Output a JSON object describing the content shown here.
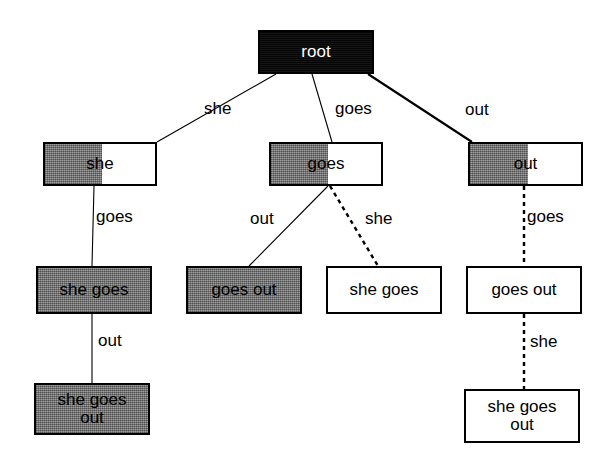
{
  "diagram": {
    "canvas": {
      "width": 601,
      "height": 468,
      "background": "#ffffff"
    },
    "colors": {
      "node_border": "#000000",
      "fill_gray": "#808080",
      "fill_black": "#0a0a0a",
      "fill_white": "#ffffff",
      "text_dark": "#000000",
      "text_light": "#ffffff",
      "edge": "#000000"
    },
    "nodes": [
      {
        "id": "root",
        "label": "root",
        "style": "black",
        "fill_fraction": 1.0,
        "x": 258,
        "y": 30,
        "w": 116,
        "h": 44,
        "level": 0
      },
      {
        "id": "she",
        "label": "she",
        "style": "half-gray",
        "fill_fraction": 0.52,
        "x": 43,
        "y": 142,
        "w": 114,
        "h": 44,
        "level": 1
      },
      {
        "id": "goes",
        "label": "goes",
        "style": "half-gray",
        "fill_fraction": 0.52,
        "x": 269,
        "y": 142,
        "w": 114,
        "h": 44,
        "level": 1
      },
      {
        "id": "out",
        "label": "out",
        "style": "half-gray",
        "fill_fraction": 0.52,
        "x": 468,
        "y": 142,
        "w": 115,
        "h": 44,
        "level": 1
      },
      {
        "id": "she-goes",
        "label": "she goes",
        "style": "gray",
        "fill_fraction": 1.0,
        "x": 36,
        "y": 266,
        "w": 116,
        "h": 48,
        "level": 2
      },
      {
        "id": "goes-out",
        "label": "goes out",
        "style": "gray",
        "fill_fraction": 1.0,
        "x": 186,
        "y": 266,
        "w": 116,
        "h": 48,
        "level": 2
      },
      {
        "id": "she-goes-alt",
        "label": "she goes",
        "style": "white",
        "fill_fraction": 0.0,
        "x": 326,
        "y": 266,
        "w": 116,
        "h": 48,
        "level": 2
      },
      {
        "id": "goes-out-alt",
        "label": "goes out",
        "style": "white",
        "fill_fraction": 0.0,
        "x": 466,
        "y": 266,
        "w": 116,
        "h": 48,
        "level": 2
      },
      {
        "id": "she-goes-out",
        "label": "she goes\nout",
        "style": "gray",
        "fill_fraction": 1.0,
        "x": 34,
        "y": 383,
        "w": 116,
        "h": 52,
        "level": 3
      },
      {
        "id": "she-goes-out-alt",
        "label": "she goes\nout",
        "style": "white",
        "fill_fraction": 0.0,
        "x": 464,
        "y": 389,
        "w": 116,
        "h": 54,
        "level": 3
      }
    ],
    "edges": [
      {
        "id": "root-she",
        "from": "root",
        "to": "she",
        "label": "she",
        "line_style": "solid-thin",
        "x1": 276,
        "y1": 74,
        "x2": 157,
        "y2": 142,
        "label_x": 204,
        "label_y": 99
      },
      {
        "id": "root-goes",
        "from": "root",
        "to": "goes",
        "label": "goes",
        "line_style": "solid-thin",
        "x1": 312,
        "y1": 74,
        "x2": 332,
        "y2": 142,
        "label_x": 335,
        "label_y": 99
      },
      {
        "id": "root-out",
        "from": "root",
        "to": "out",
        "label": "out",
        "line_style": "solid-thick",
        "x1": 368,
        "y1": 74,
        "x2": 472,
        "y2": 142,
        "label_x": 465,
        "label_y": 100
      },
      {
        "id": "she-shegoes",
        "from": "she",
        "to": "she-goes",
        "label": "goes",
        "line_style": "solid-thin",
        "x1": 94,
        "y1": 186,
        "x2": 92,
        "y2": 266,
        "label_x": 96,
        "label_y": 207
      },
      {
        "id": "goes-goesout",
        "from": "goes",
        "to": "goes-out",
        "label": "out",
        "line_style": "solid-thin",
        "x1": 328,
        "y1": 186,
        "x2": 249,
        "y2": 266,
        "label_x": 250,
        "label_y": 209
      },
      {
        "id": "goes-shegoes",
        "from": "goes",
        "to": "she-goes-alt",
        "label": "she",
        "line_style": "dashed",
        "x1": 330,
        "y1": 186,
        "x2": 378,
        "y2": 266,
        "label_x": 365,
        "label_y": 209
      },
      {
        "id": "out-goesout",
        "from": "out",
        "to": "goes-out-alt",
        "label": "goes",
        "line_style": "dashed",
        "x1": 524,
        "y1": 186,
        "x2": 524,
        "y2": 266,
        "label_x": 527,
        "label_y": 207
      },
      {
        "id": "shegoes-shegoesout",
        "from": "she-goes",
        "to": "she-goes-out",
        "label": "out",
        "line_style": "solid-thin",
        "x1": 92,
        "y1": 314,
        "x2": 92,
        "y2": 383,
        "label_x": 98,
        "label_y": 331
      },
      {
        "id": "goesout-shegoesout",
        "from": "goes-out-alt",
        "to": "she-goes-out-alt",
        "label": "she",
        "line_style": "dashed",
        "x1": 524,
        "y1": 314,
        "x2": 524,
        "y2": 389,
        "label_x": 530,
        "label_y": 332
      }
    ],
    "legend_note": ""
  }
}
